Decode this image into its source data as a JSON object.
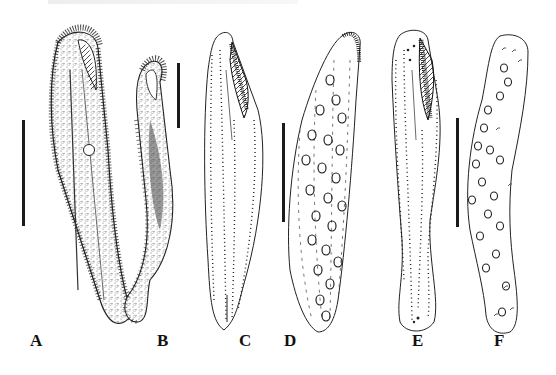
{
  "figure": {
    "panels": [
      {
        "id": "A",
        "label": "A",
        "label_pos": [
          30,
          344
        ],
        "desc": "ciliate, live cell, densely ciliated with cortical granules and contractile vacuole"
      },
      {
        "id": "B",
        "label": "B",
        "label_pos": [
          157,
          344
        ],
        "desc": "ciliate, contracted/curved lateral view"
      },
      {
        "id": "C",
        "label": "C",
        "label_pos": [
          239,
          344
        ],
        "desc": "infraciliature, ventral view, oral apparatus with adoral membranelles"
      },
      {
        "id": "D",
        "label": "D",
        "label_pos": [
          284,
          344
        ],
        "desc": "infraciliature, dorsal view with macronuclear nodules"
      },
      {
        "id": "E",
        "label": "E",
        "label_pos": [
          412,
          344
        ],
        "desc": "infraciliature, ventral view of second specimen"
      },
      {
        "id": "F",
        "label": "F",
        "label_pos": [
          494,
          344
        ],
        "desc": "infraciliature, dorsal view with macronuclear nodules"
      }
    ],
    "scale_bars": [
      {
        "panel": "A",
        "x": 22,
        "y1": 120,
        "y2": 226
      },
      {
        "panel": "B",
        "x": 177,
        "y1": 63,
        "y2": 128
      },
      {
        "panel": "C-D",
        "x": 282,
        "y1": 123,
        "y2": 222
      },
      {
        "panel": "E-F",
        "x": 456,
        "y1": 118,
        "y2": 227
      }
    ],
    "colors": {
      "ink": "#1a1a1a",
      "background": "#ffffff",
      "stipple": "#8a8a8a"
    }
  }
}
